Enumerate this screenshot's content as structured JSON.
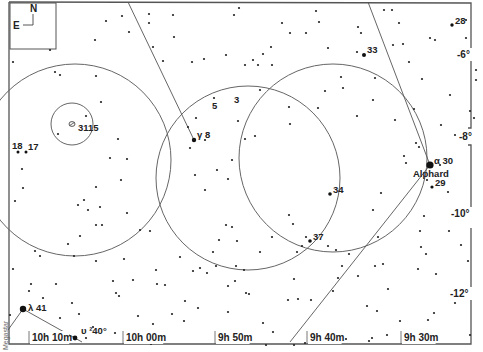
{
  "chart": {
    "credit": "Megastar",
    "orientation": {
      "north": "N",
      "east": "E"
    },
    "colors": {
      "background": "#ffffff",
      "ink": "#222222",
      "frame": "#555555",
      "circle": "#666666"
    },
    "ra_labels": [
      {
        "text": "10h 10m",
        "x": 32,
        "y": 341
      },
      {
        "text": "10h 00m",
        "x": 126,
        "y": 341
      },
      {
        "text": "9h 50m",
        "x": 218,
        "y": 341
      },
      {
        "text": "9h 40m",
        "x": 310,
        "y": 341
      },
      {
        "text": "9h 30m",
        "x": 404,
        "y": 341
      }
    ],
    "dec_labels": [
      {
        "text": "-6°",
        "x": 457,
        "y": 58
      },
      {
        "text": "-8°",
        "x": 459,
        "y": 140
      },
      {
        "text": "-10°",
        "x": 451,
        "y": 217
      },
      {
        "text": "-12°",
        "x": 450,
        "y": 297
      }
    ],
    "star_labels": [
      {
        "text": "28",
        "x": 455,
        "y": 24
      },
      {
        "text": "33",
        "x": 367,
        "y": 53
      },
      {
        "text": "3115",
        "x": 78,
        "y": 131
      },
      {
        "text": "18",
        "x": 12,
        "y": 149
      },
      {
        "text": "17",
        "x": 28,
        "y": 150
      },
      {
        "text": "5",
        "x": 212,
        "y": 109
      },
      {
        "text": "3",
        "x": 234,
        "y": 103
      },
      {
        "text": "γ 8",
        "x": 197,
        "y": 138
      },
      {
        "text": "α  30",
        "x": 434,
        "y": 164
      },
      {
        "text": "Alphard",
        "x": 413,
        "y": 177
      },
      {
        "text": "29",
        "x": 435,
        "y": 186
      },
      {
        "text": "34",
        "x": 333,
        "y": 193
      },
      {
        "text": "37",
        "x": 313,
        "y": 240
      },
      {
        "text": "λ  41",
        "x": 28,
        "y": 311
      },
      {
        "text": "υ ²40°",
        "x": 81,
        "y": 334
      }
    ],
    "named_stars": [
      {
        "name": "Alphard",
        "designation": "α Hya (30)",
        "x": 430,
        "y": 165,
        "r": 3.6
      },
      {
        "name": "γ 8",
        "x": 194,
        "y": 140,
        "r": 2.2
      },
      {
        "name": "λ 41",
        "x": 23,
        "y": 309,
        "r": 3.2
      },
      {
        "name": "υ 40",
        "x": 75,
        "y": 338,
        "r": 2.4
      },
      {
        "name": "33",
        "x": 364,
        "y": 55,
        "r": 2
      },
      {
        "name": "34",
        "x": 330,
        "y": 194,
        "r": 1.8
      },
      {
        "name": "37",
        "x": 310,
        "y": 241,
        "r": 1.8
      },
      {
        "name": "29",
        "x": 432,
        "y": 187,
        "r": 1.6
      },
      {
        "name": "28",
        "x": 452,
        "y": 25,
        "r": 1.7
      },
      {
        "name": "18",
        "x": 18,
        "y": 152,
        "r": 1.5
      },
      {
        "name": "17",
        "x": 26,
        "y": 152,
        "r": 1.5
      }
    ],
    "galaxy": {
      "name": "NGC 3115",
      "x": 72,
      "y": 124,
      "r": 2.4
    },
    "circles": [
      {
        "cx": 75,
        "cy": 160,
        "r": 96
      },
      {
        "cx": 72,
        "cy": 124,
        "r": 21
      },
      {
        "cx": 248,
        "cy": 178,
        "r": 92
      },
      {
        "cx": 333,
        "cy": 158,
        "r": 94
      }
    ],
    "lines": [
      {
        "x1": 128,
        "y1": 2,
        "x2": 194,
        "y2": 140
      },
      {
        "x1": 368,
        "y1": 2,
        "x2": 430,
        "y2": 165
      },
      {
        "x1": 430,
        "y1": 165,
        "x2": 290,
        "y2": 342
      },
      {
        "x1": 23,
        "y1": 309,
        "x2": 8,
        "y2": 330
      },
      {
        "x1": 23,
        "y1": 309,
        "x2": 82,
        "y2": 342
      }
    ],
    "field_stars": [
      [
        13,
        62
      ],
      [
        50,
        50
      ],
      [
        60,
        75
      ],
      [
        95,
        40
      ],
      [
        55,
        72
      ],
      [
        96,
        76
      ],
      [
        106,
        21
      ],
      [
        122,
        16
      ],
      [
        129,
        32
      ],
      [
        149,
        14
      ],
      [
        173,
        15
      ],
      [
        149,
        23
      ],
      [
        174,
        37
      ],
      [
        153,
        47
      ],
      [
        163,
        61
      ],
      [
        192,
        62
      ],
      [
        204,
        59
      ],
      [
        234,
        15
      ],
      [
        226,
        55
      ],
      [
        245,
        65
      ],
      [
        253,
        60
      ],
      [
        239,
        8
      ],
      [
        263,
        54
      ],
      [
        282,
        23
      ],
      [
        258,
        65
      ],
      [
        271,
        47
      ],
      [
        290,
        33
      ],
      [
        306,
        33
      ],
      [
        316,
        11
      ],
      [
        319,
        22
      ],
      [
        328,
        48
      ],
      [
        358,
        27
      ],
      [
        361,
        33
      ],
      [
        357,
        52
      ],
      [
        341,
        77
      ],
      [
        375,
        78
      ],
      [
        373,
        100
      ],
      [
        384,
        10
      ],
      [
        392,
        10
      ],
      [
        399,
        23
      ],
      [
        393,
        45
      ],
      [
        403,
        44
      ],
      [
        409,
        62
      ],
      [
        422,
        79
      ],
      [
        430,
        38
      ],
      [
        435,
        40
      ],
      [
        466,
        38
      ],
      [
        466,
        20
      ],
      [
        461,
        58
      ],
      [
        476,
        80
      ],
      [
        450,
        95
      ],
      [
        441,
        125
      ],
      [
        455,
        135
      ],
      [
        414,
        109
      ],
      [
        395,
        120
      ],
      [
        357,
        116
      ],
      [
        343,
        88
      ],
      [
        325,
        91
      ],
      [
        318,
        108
      ],
      [
        289,
        107
      ],
      [
        290,
        124
      ],
      [
        245,
        139
      ],
      [
        255,
        136
      ],
      [
        238,
        121
      ],
      [
        205,
        140
      ],
      [
        214,
        98
      ],
      [
        190,
        148
      ],
      [
        188,
        127
      ],
      [
        196,
        118
      ],
      [
        232,
        160
      ],
      [
        228,
        179
      ],
      [
        217,
        170
      ],
      [
        195,
        175
      ],
      [
        205,
        190
      ],
      [
        260,
        90
      ],
      [
        272,
        65
      ],
      [
        86,
        116
      ],
      [
        101,
        102
      ],
      [
        58,
        134
      ],
      [
        118,
        139
      ],
      [
        127,
        159
      ],
      [
        110,
        158
      ],
      [
        121,
        180
      ],
      [
        96,
        187
      ],
      [
        22,
        169
      ],
      [
        23,
        188
      ],
      [
        15,
        201
      ],
      [
        84,
        200
      ],
      [
        88,
        210
      ],
      [
        100,
        207
      ],
      [
        127,
        213
      ],
      [
        102,
        225
      ],
      [
        96,
        225
      ],
      [
        35,
        251
      ],
      [
        78,
        205
      ],
      [
        80,
        236
      ],
      [
        68,
        244
      ],
      [
        74,
        256
      ],
      [
        140,
        230
      ],
      [
        150,
        231
      ],
      [
        124,
        259
      ],
      [
        96,
        261
      ],
      [
        133,
        280
      ],
      [
        119,
        296
      ],
      [
        157,
        284
      ],
      [
        165,
        285
      ],
      [
        156,
        270
      ],
      [
        180,
        257
      ],
      [
        193,
        271
      ],
      [
        200,
        268
      ],
      [
        207,
        273
      ],
      [
        216,
        266
      ],
      [
        236,
        266
      ],
      [
        228,
        286
      ],
      [
        226,
        225
      ],
      [
        232,
        227
      ],
      [
        213,
        252
      ],
      [
        219,
        240
      ],
      [
        237,
        241
      ],
      [
        244,
        270
      ],
      [
        249,
        294
      ],
      [
        260,
        252
      ],
      [
        272,
        237
      ],
      [
        289,
        215
      ],
      [
        293,
        224
      ],
      [
        306,
        237
      ],
      [
        302,
        246
      ],
      [
        297,
        252
      ],
      [
        328,
        246
      ],
      [
        336,
        250
      ],
      [
        349,
        254
      ],
      [
        378,
        237
      ],
      [
        373,
        210
      ],
      [
        381,
        193
      ],
      [
        416,
        143
      ],
      [
        419,
        147
      ],
      [
        404,
        156
      ],
      [
        406,
        163
      ],
      [
        427,
        180
      ],
      [
        424,
        216
      ],
      [
        420,
        231
      ],
      [
        421,
        247
      ],
      [
        426,
        254
      ],
      [
        418,
        269
      ],
      [
        383,
        264
      ],
      [
        388,
        289
      ],
      [
        358,
        276
      ],
      [
        375,
        266
      ],
      [
        342,
        266
      ],
      [
        367,
        306
      ],
      [
        377,
        311
      ],
      [
        400,
        321
      ],
      [
        428,
        320
      ],
      [
        434,
        313
      ],
      [
        455,
        303
      ],
      [
        463,
        290
      ],
      [
        403,
        339
      ],
      [
        387,
        335
      ],
      [
        372,
        338
      ],
      [
        369,
        341
      ],
      [
        346,
        339
      ],
      [
        333,
        291
      ],
      [
        338,
        278
      ],
      [
        311,
        300
      ],
      [
        298,
        299
      ],
      [
        294,
        279
      ],
      [
        235,
        281
      ],
      [
        246,
        293
      ],
      [
        228,
        312
      ],
      [
        263,
        323
      ],
      [
        198,
        308
      ],
      [
        185,
        301
      ],
      [
        184,
        321
      ],
      [
        172,
        314
      ],
      [
        153,
        324
      ],
      [
        138,
        316
      ],
      [
        115,
        333
      ],
      [
        93,
        327
      ],
      [
        86,
        338
      ],
      [
        68,
        343
      ],
      [
        54,
        337
      ],
      [
        60,
        318
      ],
      [
        43,
        298
      ],
      [
        31,
        284
      ],
      [
        29,
        291
      ],
      [
        79,
        314
      ],
      [
        72,
        303
      ],
      [
        10,
        315
      ],
      [
        13,
        269
      ],
      [
        40,
        256
      ],
      [
        56,
        284
      ],
      [
        113,
        281
      ],
      [
        116,
        293
      ],
      [
        128,
        334
      ],
      [
        151,
        344
      ],
      [
        288,
        300
      ],
      [
        294,
        345
      ],
      [
        305,
        343
      ],
      [
        273,
        332
      ],
      [
        266,
        345
      ],
      [
        318,
        343
      ],
      [
        332,
        336
      ],
      [
        470,
        335
      ],
      [
        468,
        261
      ],
      [
        436,
        274
      ],
      [
        461,
        245
      ],
      [
        449,
        231
      ],
      [
        456,
        209
      ],
      [
        448,
        192
      ],
      [
        440,
        165
      ],
      [
        470,
        111
      ],
      [
        476,
        70
      ],
      [
        474,
        118
      ]
    ]
  }
}
